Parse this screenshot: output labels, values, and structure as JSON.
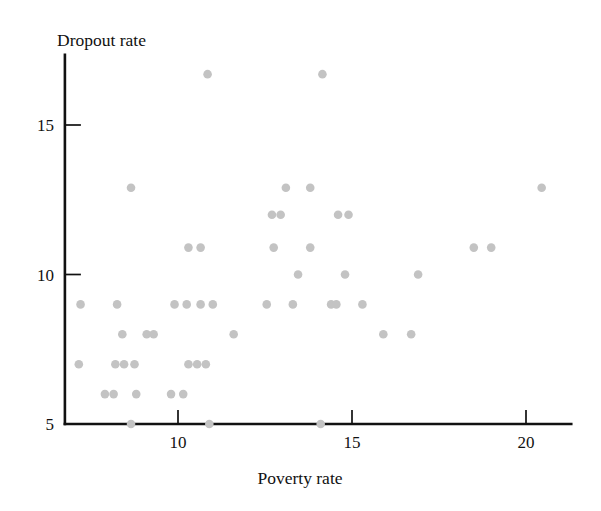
{
  "chart_data": {
    "type": "scatter",
    "title": "",
    "xlabel": "Poverty rate",
    "ylabel": "Dropout rate",
    "xlim": [
      6.75,
      21.3
    ],
    "ylim": [
      5.0,
      17.35
    ],
    "grid": false,
    "legend": null,
    "marker_color": "#c3c3c3",
    "marker_radius": 4.3,
    "axis_color": "#111111",
    "background": "#ffffff",
    "xticks": [
      10,
      15,
      20
    ],
    "xtick_labels": [
      "10",
      "15",
      "20"
    ],
    "yticks": [
      5,
      10,
      15
    ],
    "ytick_labels": [
      "5",
      "10",
      "15"
    ],
    "points": [
      {
        "x": 10.85,
        "y": 16.7
      },
      {
        "x": 14.15,
        "y": 16.7
      },
      {
        "x": 8.65,
        "y": 12.9
      },
      {
        "x": 13.1,
        "y": 12.9
      },
      {
        "x": 13.8,
        "y": 12.9
      },
      {
        "x": 20.45,
        "y": 12.9
      },
      {
        "x": 12.7,
        "y": 12.0
      },
      {
        "x": 12.95,
        "y": 12.0
      },
      {
        "x": 14.6,
        "y": 12.0
      },
      {
        "x": 14.9,
        "y": 12.0
      },
      {
        "x": 10.3,
        "y": 10.9
      },
      {
        "x": 10.65,
        "y": 10.9
      },
      {
        "x": 12.75,
        "y": 10.9
      },
      {
        "x": 13.8,
        "y": 10.9
      },
      {
        "x": 18.5,
        "y": 10.9
      },
      {
        "x": 19.0,
        "y": 10.9
      },
      {
        "x": 13.45,
        "y": 10.0
      },
      {
        "x": 14.8,
        "y": 10.0
      },
      {
        "x": 16.9,
        "y": 10.0
      },
      {
        "x": 7.2,
        "y": 9.0
      },
      {
        "x": 8.25,
        "y": 9.0
      },
      {
        "x": 9.9,
        "y": 9.0
      },
      {
        "x": 10.25,
        "y": 9.0
      },
      {
        "x": 10.65,
        "y": 9.0
      },
      {
        "x": 11.0,
        "y": 9.0
      },
      {
        "x": 12.55,
        "y": 9.0
      },
      {
        "x": 13.3,
        "y": 9.0
      },
      {
        "x": 14.4,
        "y": 9.0
      },
      {
        "x": 14.55,
        "y": 9.0
      },
      {
        "x": 15.3,
        "y": 9.0
      },
      {
        "x": 8.4,
        "y": 8.0
      },
      {
        "x": 9.1,
        "y": 8.0
      },
      {
        "x": 9.3,
        "y": 8.0
      },
      {
        "x": 11.6,
        "y": 8.0
      },
      {
        "x": 15.9,
        "y": 8.0
      },
      {
        "x": 16.7,
        "y": 8.0
      },
      {
        "x": 7.15,
        "y": 7.0
      },
      {
        "x": 8.2,
        "y": 7.0
      },
      {
        "x": 8.45,
        "y": 7.0
      },
      {
        "x": 8.75,
        "y": 7.0
      },
      {
        "x": 10.3,
        "y": 7.0
      },
      {
        "x": 10.55,
        "y": 7.0
      },
      {
        "x": 10.8,
        "y": 7.0
      },
      {
        "x": 7.9,
        "y": 6.0
      },
      {
        "x": 8.15,
        "y": 6.0
      },
      {
        "x": 8.8,
        "y": 6.0
      },
      {
        "x": 9.8,
        "y": 6.0
      },
      {
        "x": 10.15,
        "y": 6.0
      },
      {
        "x": 8.65,
        "y": 5.0
      },
      {
        "x": 10.9,
        "y": 5.0
      },
      {
        "x": 14.1,
        "y": 5.0
      }
    ]
  }
}
